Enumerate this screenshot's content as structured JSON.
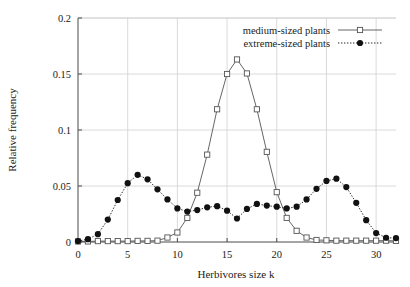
{
  "chart_data": {
    "type": "line",
    "title": "",
    "xlabel": "Herbivores size k",
    "ylabel": "Relative frequency",
    "xlim": [
      0,
      32
    ],
    "ylim": [
      0,
      0.2
    ],
    "xticks": [
      0,
      5,
      10,
      15,
      20,
      25,
      30
    ],
    "xtick_labels": [
      "0",
      "5",
      "10",
      "15",
      "20",
      "25",
      "30"
    ],
    "yticks": [
      0,
      0.05,
      0.1,
      0.15,
      0.2
    ],
    "ytick_labels": [
      "0",
      "0.05",
      "0.1",
      "0.15",
      "0.2"
    ],
    "grid": true,
    "legend_position": "top-right",
    "x": [
      0,
      1,
      2,
      3,
      4,
      5,
      6,
      7,
      8,
      9,
      10,
      11,
      12,
      13,
      14,
      15,
      16,
      17,
      18,
      19,
      20,
      21,
      22,
      23,
      24,
      25,
      26,
      27,
      28,
      29,
      30,
      31,
      32
    ],
    "series": [
      {
        "name": "medium-sized plants",
        "marker": "open-square",
        "line_style": "solid",
        "color": "#555555",
        "values": [
          0.0005,
          0.0005,
          0.0008,
          0.0008,
          0.0008,
          0.0008,
          0.001,
          0.001,
          0.0012,
          0.004,
          0.0085,
          0.0215,
          0.044,
          0.078,
          0.1185,
          0.15,
          0.163,
          0.1505,
          0.1185,
          0.0805,
          0.0445,
          0.0215,
          0.01,
          0.004,
          0.0018,
          0.0015,
          0.0012,
          0.0012,
          0.0012,
          0.0012,
          0.0012,
          0.0012,
          0.001
        ]
      },
      {
        "name": "extreme-sized plants",
        "marker": "filled-circle",
        "line_style": "dotted",
        "color": "#111111",
        "values": [
          0.0008,
          0.0025,
          0.007,
          0.02,
          0.0375,
          0.0525,
          0.06,
          0.056,
          0.047,
          0.038,
          0.03,
          0.0272,
          0.0285,
          0.031,
          0.032,
          0.028,
          0.021,
          0.0295,
          0.034,
          0.0325,
          0.0315,
          0.03,
          0.0315,
          0.038,
          0.0475,
          0.0545,
          0.0565,
          0.049,
          0.035,
          0.0195,
          0.008,
          0.0038,
          0.0035
        ]
      }
    ]
  },
  "figure": {
    "background_color": "#ffffff",
    "grid_color": "#d0d0d0",
    "axis_color": "#4a4a4a"
  }
}
